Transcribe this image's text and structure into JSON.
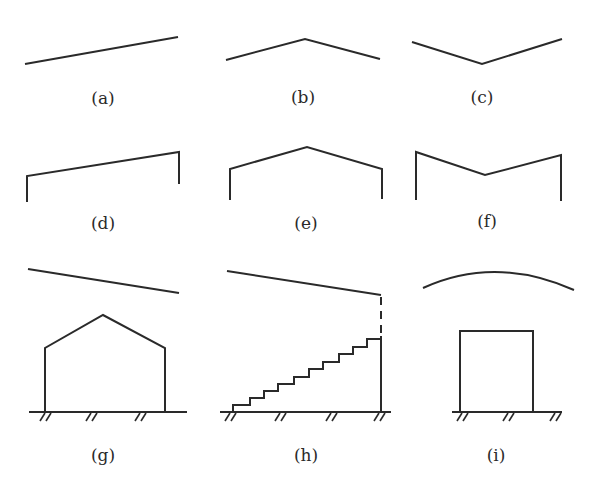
{
  "figure": {
    "panels": [
      {
        "id": "a",
        "label": "(a)",
        "description": "single sloped line rising left to right"
      },
      {
        "id": "b",
        "label": "(b)",
        "description": "inverted V (ridge)"
      },
      {
        "id": "c",
        "label": "(c)",
        "description": "V shape (valley), right arm higher"
      },
      {
        "id": "d",
        "label": "(d)",
        "description": "mono-pitch roof on two posts"
      },
      {
        "id": "e",
        "label": "(e)",
        "description": "gable roof on two posts"
      },
      {
        "id": "f",
        "label": "(f)",
        "description": "butterfly roof on two posts"
      },
      {
        "id": "g",
        "label": "(g)",
        "description": "sloped line above a gabled house on hatched ground"
      },
      {
        "id": "h",
        "label": "(h)",
        "description": "sloped line with dashed extension down to a staircase rising to a wall on hatched ground"
      },
      {
        "id": "i",
        "label": "(i)",
        "description": "arc above a rectangular box on hatched ground"
      }
    ]
  },
  "colors": {
    "stroke": "#2a2a2a",
    "background": "#ffffff"
  }
}
